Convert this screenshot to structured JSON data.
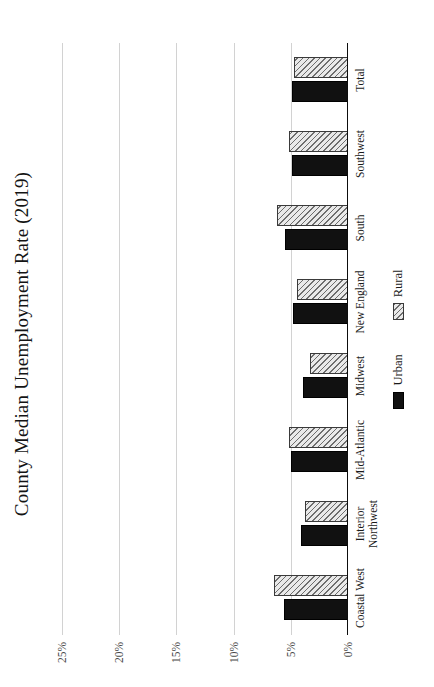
{
  "chart_data": {
    "type": "bar",
    "title": "County Median Unemployment Rate (2019)",
    "xlabel": "",
    "ylabel": "",
    "orientation": "rotated-90-ccw",
    "grid": true,
    "legend_position": "bottom-center",
    "ylim": [
      0,
      26.5
    ],
    "yticks": [
      "0%",
      "5%",
      "10%",
      "15%",
      "20%",
      "25%"
    ],
    "ytick_values": [
      0,
      5,
      10,
      15,
      20,
      25
    ],
    "categories": [
      "Coastal West",
      "Interior Northwest",
      "Mid-Atlantic",
      "Midwest",
      "New England",
      "South",
      "Southwest",
      "Total"
    ],
    "series": [
      {
        "name": "Urban",
        "color": "#111111",
        "values": [
          5.6,
          4.1,
          5.0,
          3.9,
          4.8,
          5.5,
          4.9,
          4.9
        ]
      },
      {
        "name": "Rural",
        "color": "#e9e9e9",
        "values": [
          6.5,
          3.8,
          5.2,
          3.3,
          4.5,
          6.2,
          5.2,
          4.7
        ]
      }
    ]
  },
  "legend": {
    "items": [
      {
        "label": "Urban",
        "swatch": "solid-black-swatch"
      },
      {
        "label": "Rural",
        "swatch": "hatched-grey-swatch"
      }
    ]
  }
}
